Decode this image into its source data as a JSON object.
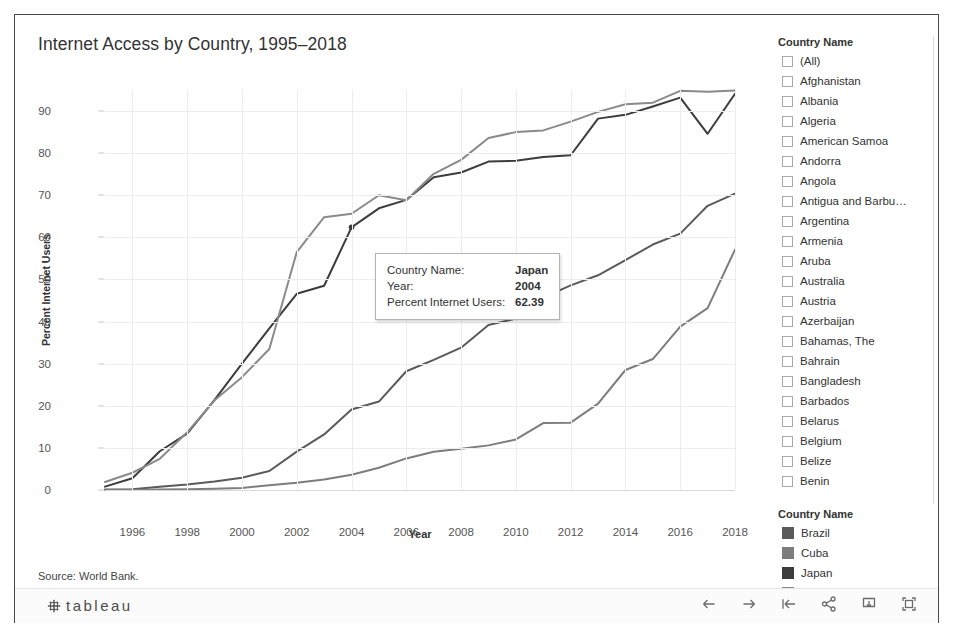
{
  "title": "Internet Access by Country, 1995–2018",
  "source_caption": "Source: World Bank.",
  "chart_data": {
    "type": "line",
    "title": "Internet Access by Country, 1995–2018",
    "xlabel": "Year",
    "ylabel": "Percent Internet Users",
    "xlim": [
      1995,
      2018
    ],
    "ylim": [
      0,
      95
    ],
    "yticks": [
      0,
      10,
      20,
      30,
      40,
      50,
      60,
      70,
      80,
      90
    ],
    "xticks": [
      1996,
      1998,
      2000,
      2002,
      2004,
      2006,
      2008,
      2010,
      2012,
      2014,
      2016,
      2018
    ],
    "grid": true,
    "legend_position": "right",
    "x": [
      1995,
      1996,
      1997,
      1998,
      1999,
      2000,
      2001,
      2002,
      2003,
      2004,
      2005,
      2006,
      2007,
      2008,
      2009,
      2010,
      2011,
      2012,
      2013,
      2014,
      2015,
      2016,
      2017,
      2018
    ],
    "series": [
      {
        "name": "Japan",
        "color": "#3c3c3c",
        "values": [
          0.8,
          2.8,
          9.2,
          13.4,
          21.4,
          30.0,
          38.4,
          46.6,
          48.5,
          62.39,
          66.9,
          68.9,
          74.3,
          75.4,
          78.0,
          78.2,
          79.1,
          79.5,
          88.2,
          89.1,
          91.1,
          93.2,
          84.6,
          94.1
        ]
      },
      {
        "name": "United Kingdom",
        "color": "#8a8a8a",
        "values": [
          1.9,
          4.1,
          7.4,
          13.7,
          21.3,
          26.8,
          33.5,
          56.5,
          64.8,
          65.6,
          70.0,
          68.8,
          75.1,
          78.4,
          83.6,
          85.0,
          85.4,
          87.5,
          89.8,
          91.6,
          92.0,
          94.8,
          94.6,
          94.9
        ]
      },
      {
        "name": "Brazil",
        "color": "#5a5a5a",
        "values": [
          0.1,
          0.2,
          0.8,
          1.3,
          2.0,
          2.9,
          4.5,
          9.1,
          13.2,
          19.1,
          21.0,
          28.2,
          30.9,
          33.8,
          39.2,
          40.7,
          45.7,
          48.6,
          51.0,
          54.6,
          58.3,
          60.9,
          67.5,
          70.4
        ]
      },
      {
        "name": "Cuba",
        "color": "#7d7d7d",
        "values": [
          0.0,
          0.0,
          0.1,
          0.2,
          0.3,
          0.5,
          1.1,
          1.7,
          2.5,
          3.6,
          5.3,
          7.5,
          9.1,
          9.8,
          10.6,
          12.0,
          15.9,
          16.0,
          20.5,
          28.5,
          31.1,
          38.8,
          43.2,
          57.1
        ]
      }
    ]
  },
  "filter": {
    "title": "Country Name",
    "items": [
      "(All)",
      "Afghanistan",
      "Albania",
      "Algeria",
      "American Samoa",
      "Andorra",
      "Angola",
      "Antigua and Barbu…",
      "Argentina",
      "Armenia",
      "Aruba",
      "Australia",
      "Austria",
      "Azerbaijan",
      "Bahamas, The",
      "Bahrain",
      "Bangladesh",
      "Barbados",
      "Belarus",
      "Belgium",
      "Belize",
      "Benin",
      "Bermuda",
      "Bhutan",
      "Bolivia"
    ]
  },
  "legend": {
    "title": "Country Name",
    "items": [
      {
        "label": "Brazil",
        "color": "#5a5a5a"
      },
      {
        "label": "Cuba",
        "color": "#7d7d7d"
      },
      {
        "label": "Japan",
        "color": "#3c3c3c"
      },
      {
        "label": "United Kingdom",
        "color": "#8a8a8a"
      }
    ]
  },
  "tooltip": {
    "rows": [
      {
        "label": "Country Name:",
        "value": "Japan"
      },
      {
        "label": "Year:",
        "value": "2004"
      },
      {
        "label": "Percent Internet Users:",
        "value": "62.39"
      }
    ]
  },
  "toolbar": {
    "logo_text": "tableau",
    "icons": [
      "back-arrow-icon",
      "forward-arrow-icon",
      "revert-icon",
      "share-icon",
      "download-icon",
      "fullscreen-icon"
    ]
  }
}
